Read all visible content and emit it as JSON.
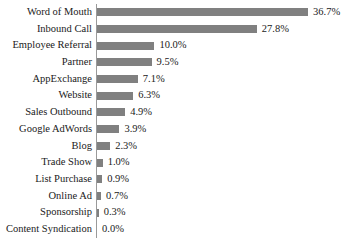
{
  "chart_data": {
    "type": "bar",
    "orientation": "horizontal",
    "title": "",
    "subtitle": "",
    "xlabel": "",
    "ylabel": "",
    "grid": false,
    "legend": false,
    "legend_position": "none",
    "axis_line": true,
    "value_suffix": "%",
    "xlim": [
      0,
      36.7
    ],
    "bar_color": "#808080",
    "text_color": "#1a1a1a",
    "axis_color": "#9a9a9a",
    "background": "#ffffff",
    "categories": [
      "Word of Mouth",
      "Inbound Call",
      "Employee Referral",
      "Partner",
      "AppExchange",
      "Website",
      "Sales Outbound",
      "Google AdWords",
      "Blog",
      "Trade Show",
      "List Purchase",
      "Online Ad",
      "Sponsorship",
      "Content Syndication"
    ],
    "values": [
      36.7,
      27.8,
      10.0,
      9.5,
      7.1,
      6.3,
      4.9,
      3.9,
      2.3,
      1.0,
      0.9,
      0.7,
      0.3,
      0.0
    ],
    "data_labels": [
      "36.7%",
      "27.8%",
      "10.0%",
      "9.5%",
      "7.1%",
      "6.3%",
      "4.9%",
      "3.9%",
      "2.3%",
      "1.0%",
      "0.9%",
      "0.7%",
      "0.3%",
      "0.0%"
    ],
    "points": [
      {
        "category": "Word of Mouth",
        "value": 36.7,
        "label": "36.7%"
      },
      {
        "category": "Inbound Call",
        "value": 27.8,
        "label": "27.8%"
      },
      {
        "category": "Employee Referral",
        "value": 10.0,
        "label": "10.0%"
      },
      {
        "category": "Partner",
        "value": 9.5,
        "label": "9.5%"
      },
      {
        "category": "AppExchange",
        "value": 7.1,
        "label": "7.1%"
      },
      {
        "category": "Website",
        "value": 6.3,
        "label": "6.3%"
      },
      {
        "category": "Sales Outbound",
        "value": 4.9,
        "label": "4.9%"
      },
      {
        "category": "Google AdWords",
        "value": 3.9,
        "label": "3.9%"
      },
      {
        "category": "Blog",
        "value": 2.3,
        "label": "2.3%"
      },
      {
        "category": "Trade Show",
        "value": 1.0,
        "label": "1.0%"
      },
      {
        "category": "List Purchase",
        "value": 0.9,
        "label": "0.9%"
      },
      {
        "category": "Online Ad",
        "value": 0.7,
        "label": "0.7%"
      },
      {
        "category": "Sponsorship",
        "value": 0.3,
        "label": "0.3%"
      },
      {
        "category": "Content Syndication",
        "value": 0.0,
        "label": "0.0%"
      }
    ]
  }
}
